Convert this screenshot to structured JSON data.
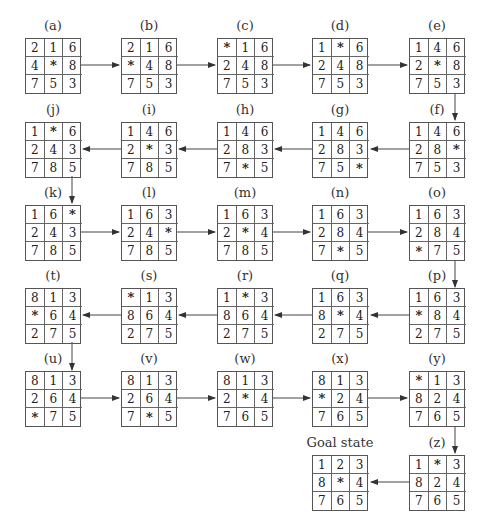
{
  "diagram": {
    "blank_symbol": "*",
    "states": [
      {
        "id": "a",
        "label": "(a)",
        "tiles": [
          "2",
          "1",
          "6",
          "4",
          "*",
          "8",
          "7",
          "5",
          "3"
        ]
      },
      {
        "id": "b",
        "label": "(b)",
        "tiles": [
          "2",
          "1",
          "6",
          "*",
          "4",
          "8",
          "7",
          "5",
          "3"
        ]
      },
      {
        "id": "c",
        "label": "(c)",
        "tiles": [
          "*",
          "1",
          "6",
          "2",
          "4",
          "8",
          "7",
          "5",
          "3"
        ]
      },
      {
        "id": "d",
        "label": "(d)",
        "tiles": [
          "1",
          "*",
          "6",
          "2",
          "4",
          "8",
          "7",
          "5",
          "3"
        ]
      },
      {
        "id": "e",
        "label": "(e)",
        "tiles": [
          "1",
          "4",
          "6",
          "2",
          "*",
          "8",
          "7",
          "5",
          "3"
        ]
      },
      {
        "id": "f",
        "label": "(f)",
        "tiles": [
          "1",
          "4",
          "6",
          "2",
          "8",
          "*",
          "7",
          "5",
          "3"
        ]
      },
      {
        "id": "g",
        "label": "(g)",
        "tiles": [
          "1",
          "4",
          "6",
          "2",
          "8",
          "3",
          "7",
          "5",
          "*"
        ]
      },
      {
        "id": "h",
        "label": "(h)",
        "tiles": [
          "1",
          "4",
          "6",
          "2",
          "8",
          "3",
          "7",
          "*",
          "5"
        ]
      },
      {
        "id": "i",
        "label": "(i)",
        "tiles": [
          "1",
          "4",
          "6",
          "2",
          "*",
          "3",
          "7",
          "8",
          "5"
        ]
      },
      {
        "id": "j",
        "label": "(j)",
        "tiles": [
          "1",
          "*",
          "6",
          "2",
          "4",
          "3",
          "7",
          "8",
          "5"
        ]
      },
      {
        "id": "k",
        "label": "(k)",
        "tiles": [
          "1",
          "6",
          "*",
          "2",
          "4",
          "3",
          "7",
          "8",
          "5"
        ]
      },
      {
        "id": "l",
        "label": "(l)",
        "tiles": [
          "1",
          "6",
          "3",
          "2",
          "4",
          "*",
          "7",
          "8",
          "5"
        ]
      },
      {
        "id": "m",
        "label": "(m)",
        "tiles": [
          "1",
          "6",
          "3",
          "2",
          "*",
          "4",
          "7",
          "8",
          "5"
        ]
      },
      {
        "id": "n",
        "label": "(n)",
        "tiles": [
          "1",
          "6",
          "3",
          "2",
          "8",
          "4",
          "7",
          "*",
          "5"
        ]
      },
      {
        "id": "o",
        "label": "(o)",
        "tiles": [
          "1",
          "6",
          "3",
          "2",
          "8",
          "4",
          "*",
          "7",
          "5"
        ]
      },
      {
        "id": "p",
        "label": "(p)",
        "tiles": [
          "1",
          "6",
          "3",
          "*",
          "8",
          "4",
          "2",
          "7",
          "5"
        ]
      },
      {
        "id": "q",
        "label": "(q)",
        "tiles": [
          "1",
          "6",
          "3",
          "8",
          "*",
          "4",
          "2",
          "7",
          "5"
        ]
      },
      {
        "id": "r",
        "label": "(r)",
        "tiles": [
          "1",
          "*",
          "3",
          "8",
          "6",
          "4",
          "2",
          "7",
          "5"
        ]
      },
      {
        "id": "s",
        "label": "(s)",
        "tiles": [
          "*",
          "1",
          "3",
          "8",
          "6",
          "4",
          "2",
          "7",
          "5"
        ]
      },
      {
        "id": "t",
        "label": "(t)",
        "tiles": [
          "8",
          "1",
          "3",
          "*",
          "6",
          "4",
          "2",
          "7",
          "5"
        ]
      },
      {
        "id": "u",
        "label": "(u)",
        "tiles": [
          "8",
          "1",
          "3",
          "2",
          "6",
          "4",
          "*",
          "7",
          "5"
        ]
      },
      {
        "id": "v",
        "label": "(v)",
        "tiles": [
          "8",
          "1",
          "3",
          "2",
          "6",
          "4",
          "7",
          "*",
          "5"
        ]
      },
      {
        "id": "w",
        "label": "(w)",
        "tiles": [
          "8",
          "1",
          "3",
          "2",
          "*",
          "4",
          "7",
          "6",
          "5"
        ]
      },
      {
        "id": "x",
        "label": "(x)",
        "tiles": [
          "8",
          "1",
          "3",
          "*",
          "2",
          "4",
          "7",
          "6",
          "5"
        ]
      },
      {
        "id": "y",
        "label": "(y)",
        "tiles": [
          "*",
          "1",
          "3",
          "8",
          "2",
          "4",
          "7",
          "6",
          "5"
        ]
      },
      {
        "id": "z",
        "label": "(z)",
        "tiles": [
          "1",
          "*",
          "3",
          "8",
          "2",
          "4",
          "7",
          "6",
          "5"
        ]
      },
      {
        "id": "goal",
        "label": "Goal state",
        "tiles": [
          "1",
          "2",
          "3",
          "8",
          "*",
          "4",
          "7",
          "6",
          "5"
        ]
      }
    ]
  }
}
